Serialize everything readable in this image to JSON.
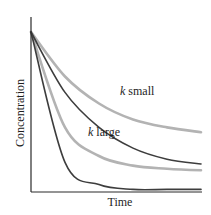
{
  "chart_data": {
    "type": "line",
    "title": "",
    "xlabel": "Time",
    "ylabel": "Concentration",
    "xlim": [
      0,
      10
    ],
    "ylim": [
      0,
      1
    ],
    "grid": false,
    "ticks": false,
    "legend": null,
    "annotations": [
      {
        "text_var": "k",
        "text_rest": " small",
        "near_series": "light gray upper"
      },
      {
        "text_var": "k",
        "text_rest": " large",
        "near_series": "light gray lower"
      }
    ],
    "series": [
      {
        "name": "light gray upper (k small)",
        "color": "#b3b3b3",
        "x": [
          0,
          2,
          4,
          6,
          8,
          10
        ],
        "values": [
          1.0,
          0.72,
          0.55,
          0.45,
          0.4,
          0.37
        ]
      },
      {
        "name": "dark upper",
        "color": "#3d3d3d",
        "x": [
          0,
          2,
          4,
          6,
          8,
          10
        ],
        "values": [
          1.0,
          0.62,
          0.4,
          0.27,
          0.2,
          0.17
        ]
      },
      {
        "name": "light gray lower (k large)",
        "color": "#b3b3b3",
        "x": [
          0,
          2,
          4,
          6,
          8,
          10
        ],
        "values": [
          1.0,
          0.4,
          0.22,
          0.16,
          0.14,
          0.13
        ]
      },
      {
        "name": "dark lower",
        "color": "#3d3d3d",
        "x": [
          0,
          2,
          4,
          6,
          8,
          10
        ],
        "values": [
          1.0,
          0.18,
          0.04,
          0.01,
          0.01,
          0.01
        ]
      }
    ]
  },
  "labels": {
    "ylabel": "Concentration",
    "xlabel": "Time",
    "k_symbol": "k",
    "small_suffix": " small",
    "large_suffix": " large"
  },
  "colors": {
    "axis": "#2a2a2a",
    "dark_curve": "#3d3d3d",
    "light_curve": "#b3b3b3"
  }
}
